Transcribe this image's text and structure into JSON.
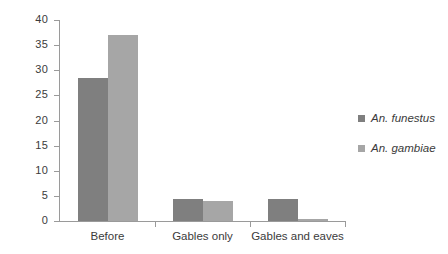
{
  "chart_data": {
    "type": "bar",
    "title": "",
    "subtitle": "",
    "xlabel": "",
    "ylabel": "",
    "categories": [
      "Before",
      "Gables only",
      "Gables and eaves"
    ],
    "series": [
      {
        "name": "An. funestus",
        "color": "#7f7f7f",
        "values": [
          28.5,
          4.4,
          4.3
        ]
      },
      {
        "name": "An. gambiae",
        "color": "#a6a6a6",
        "values": [
          37.0,
          3.9,
          0.5
        ]
      }
    ],
    "ylim": [
      0,
      40
    ],
    "ytick_labels": [
      "0",
      "5",
      "10",
      "15",
      "20",
      "25",
      "30",
      "35",
      "40"
    ],
    "ytick_values": [
      0,
      5,
      10,
      15,
      20,
      25,
      30,
      35,
      40
    ],
    "grid": false,
    "legend_position": "right",
    "background_color": "#ffffff",
    "axis_color": "#9a9a9a",
    "text_color": "#3b3b3b"
  }
}
